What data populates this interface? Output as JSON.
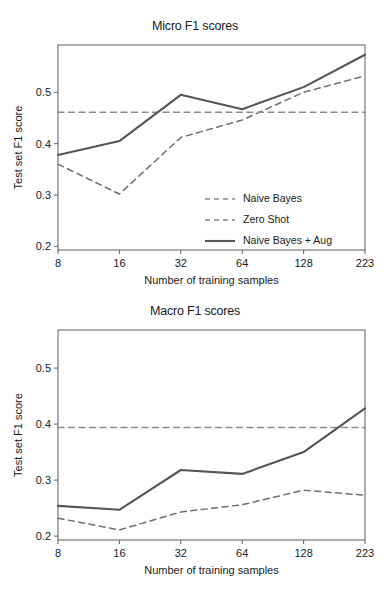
{
  "figure": {
    "axis_title_x": "Number of training samples",
    "axis_title_y": "Test set F1 score"
  },
  "chart_data": [
    {
      "type": "line",
      "id": "micro",
      "title": "Micro F1 scores",
      "xlabel": "Number of training samples",
      "ylabel": "Test set F1 score",
      "categories": [
        "8",
        "16",
        "32",
        "64",
        "128",
        "223"
      ],
      "xticklabels": [
        "8",
        "16",
        "32",
        "64",
        "128",
        "223"
      ],
      "yticklabels": [
        "0.2",
        "0.3",
        "0.4",
        "0.5"
      ],
      "ytickvalues": [
        0.2,
        0.3,
        0.4,
        0.5
      ],
      "ylim": [
        0.193,
        0.592
      ],
      "grid": false,
      "legend_position": "lower right",
      "series": [
        {
          "name": "Naive Bayes",
          "style": "dashed",
          "color": "#6e6e6e",
          "values": [
            0.36,
            0.302,
            0.412,
            0.446,
            0.5,
            0.532
          ]
        },
        {
          "name": "Zero Shot",
          "style": "dashed-flat",
          "color": "#8a8a8a",
          "values": [
            0.461,
            0.461,
            0.461,
            0.461,
            0.461,
            0.461
          ]
        },
        {
          "name": "Naive Bayes + Aug",
          "style": "solid",
          "color": "#555555",
          "values": [
            0.378,
            0.405,
            0.495,
            0.467,
            0.51,
            0.573
          ]
        }
      ]
    },
    {
      "type": "line",
      "id": "macro",
      "title": "Macro F1 scores",
      "xlabel": "Number of training samples",
      "ylabel": "Test set F1 score",
      "categories": [
        "8",
        "16",
        "32",
        "64",
        "128",
        "223"
      ],
      "xticklabels": [
        "8",
        "16",
        "32",
        "64",
        "128",
        "223"
      ],
      "yticklabels": [
        "0.2",
        "0.3",
        "0.4",
        "0.5"
      ],
      "ytickvalues": [
        0.2,
        0.3,
        0.4,
        0.5
      ],
      "ylim": [
        0.193,
        0.568
      ],
      "grid": false,
      "legend_position": "none",
      "series": [
        {
          "name": "Naive Bayes",
          "style": "dashed",
          "color": "#6e6e6e",
          "values": [
            0.232,
            0.211,
            0.243,
            0.256,
            0.282,
            0.273
          ]
        },
        {
          "name": "Zero Shot",
          "style": "dashed-flat",
          "color": "#8a8a8a",
          "values": [
            0.394,
            0.394,
            0.394,
            0.394,
            0.394,
            0.394
          ]
        },
        {
          "name": "Naive Bayes + Aug",
          "style": "solid",
          "color": "#555555",
          "values": [
            0.254,
            0.247,
            0.318,
            0.311,
            0.35,
            0.428
          ]
        }
      ]
    }
  ],
  "legend": {
    "items": [
      {
        "label": "Naive Bayes",
        "style": "dashed"
      },
      {
        "label": "Zero Shot",
        "style": "dashed"
      },
      {
        "label": "Naive Bayes + Aug",
        "style": "solid"
      }
    ]
  }
}
